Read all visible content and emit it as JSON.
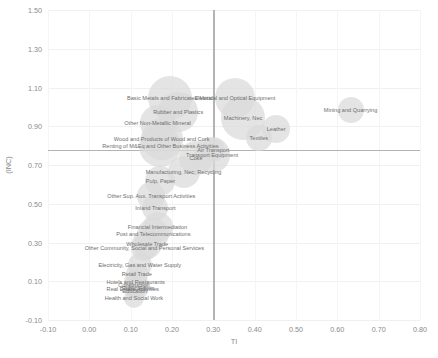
{
  "chart_data": {
    "type": "scatter",
    "title": "",
    "xlabel": "TI",
    "ylabel": "(INC)",
    "xlim": [
      -0.1,
      0.8
    ],
    "ylim": [
      -0.1,
      1.5
    ],
    "xticks": [
      "-0.10",
      "0.00",
      "0.10",
      "0.20",
      "0.30",
      "0.40",
      "0.50",
      "0.60",
      "0.70",
      "0.80"
    ],
    "xtick_values": [
      -0.1,
      0.0,
      0.1,
      0.2,
      0.3,
      0.4,
      0.5,
      0.6,
      0.7,
      0.8
    ],
    "yticks": [
      "1.50",
      "1.30",
      "1.10",
      "0.90",
      "0.70",
      "0.50",
      "0.30",
      "0.10",
      "-0.10"
    ],
    "ytick_values": [
      1.5,
      1.3,
      1.1,
      0.9,
      0.7,
      0.5,
      0.3,
      0.1,
      -0.1
    ],
    "grid": true,
    "legend": "none",
    "reference_lines": {
      "vertical_x": 0.3,
      "horizontal_y": 0.78
    },
    "bubble_color": "#d9d9d9",
    "points": [
      {
        "label": "Mining and Quarrying",
        "x": 0.632,
        "y": 0.985,
        "size": 26
      },
      {
        "label": "Basic Metals and Fabricated Metal",
        "x": 0.195,
        "y": 1.045,
        "size": 44
      },
      {
        "label": "Electrical and Optical Equipment",
        "x": 0.352,
        "y": 1.045,
        "size": 40
      },
      {
        "label": "Rubber and Plastics",
        "x": 0.215,
        "y": 0.975,
        "size": 40
      },
      {
        "label": "Machinery, Nec",
        "x": 0.372,
        "y": 0.945,
        "size": 44
      },
      {
        "label": "Other Non-Metallic Mineral",
        "x": 0.165,
        "y": 0.915,
        "size": 36
      },
      {
        "label": "Leather",
        "x": 0.452,
        "y": 0.885,
        "size": 28
      },
      {
        "label": "Wood and Products of Wood and Cork",
        "x": 0.175,
        "y": 0.835,
        "size": 42
      },
      {
        "label": "Renting of M&Eq and Other Business Activities",
        "x": 0.172,
        "y": 0.8,
        "size": 42
      },
      {
        "label": "Textiles",
        "x": 0.41,
        "y": 0.838,
        "size": 26
      },
      {
        "label": "Air Transport",
        "x": 0.3,
        "y": 0.775,
        "size": 24
      },
      {
        "label": "Transport Equipment",
        "x": 0.297,
        "y": 0.752,
        "size": 36
      },
      {
        "label": "Coke",
        "x": 0.258,
        "y": 0.735,
        "size": 34
      },
      {
        "label": "Manufacturing, Nec; Recycling",
        "x": 0.228,
        "y": 0.665,
        "size": 32
      },
      {
        "label": "Pulp, Paper",
        "x": 0.172,
        "y": 0.617,
        "size": 30
      },
      {
        "label": "Other Sup. Aux. Transport Activities",
        "x": 0.15,
        "y": 0.54,
        "size": 28
      },
      {
        "label": "Inland Transport",
        "x": 0.16,
        "y": 0.48,
        "size": 26
      },
      {
        "label": "Financial Intermediation",
        "x": 0.165,
        "y": 0.378,
        "size": 30
      },
      {
        "label": "Post and Telecommunications",
        "x": 0.155,
        "y": 0.345,
        "size": 32
      },
      {
        "label": "Wholesale Trade",
        "x": 0.14,
        "y": 0.292,
        "size": 30
      },
      {
        "label": "Other Community, Social and Personal Services",
        "x": 0.133,
        "y": 0.272,
        "size": 26
      },
      {
        "label": "Electricity, Gas and Water Supply",
        "x": 0.122,
        "y": 0.182,
        "size": 24
      },
      {
        "label": "Retail Trade",
        "x": 0.115,
        "y": 0.135,
        "size": 22
      },
      {
        "label": "Hotels and Restaurants",
        "x": 0.112,
        "y": 0.098,
        "size": 24
      },
      {
        "label": "Public Admin",
        "x": 0.118,
        "y": 0.065,
        "size": 22
      },
      {
        "label": "Real Estate Activities",
        "x": 0.105,
        "y": 0.058,
        "size": 18
      },
      {
        "label": "Education",
        "x": 0.11,
        "y": 0.048,
        "size": 18
      },
      {
        "label": "Health and Social Work",
        "x": 0.108,
        "y": 0.012,
        "size": 20
      },
      {
        "label": "Construction",
        "x": 0.108,
        "y": 0.082,
        "size": 20
      }
    ]
  }
}
